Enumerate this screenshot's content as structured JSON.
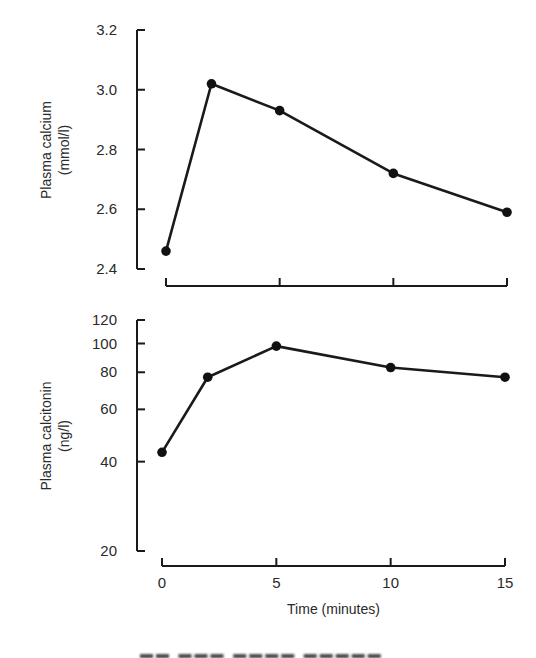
{
  "chart_data": [
    {
      "type": "line",
      "title": "",
      "xlabel": "",
      "ylabel": "Plasma calcium",
      "ylabel_unit": "(mmol/l)",
      "x": [
        0,
        2,
        5,
        10,
        15
      ],
      "series": [
        {
          "name": "Plasma calcium",
          "values": [
            2.46,
            3.02,
            2.93,
            2.72,
            2.59
          ]
        }
      ],
      "ylim": [
        2.4,
        3.2
      ],
      "yticks": [
        2.4,
        2.6,
        2.8,
        3.0,
        3.2
      ],
      "ytick_labels": [
        "2.4",
        "2.6",
        "2.8",
        "3.0",
        "3.2"
      ],
      "xlim": [
        0,
        15
      ],
      "xticks": [
        0,
        5,
        10,
        15
      ],
      "show_xtick_labels": false,
      "yscale": "linear",
      "grid": false,
      "markers": "filled-circle"
    },
    {
      "type": "line",
      "title": "",
      "xlabel": "Time (minutes)",
      "ylabel": "Plasma calcitonin",
      "ylabel_unit": "(ng/l)",
      "x": [
        0,
        2,
        5,
        10,
        15
      ],
      "series": [
        {
          "name": "Plasma calcitonin",
          "values": [
            43,
            77,
            98,
            83,
            77
          ]
        }
      ],
      "ylim": [
        20,
        120
      ],
      "yticks": [
        20,
        40,
        60,
        80,
        100,
        120
      ],
      "ytick_labels": [
        "20",
        "40",
        "60",
        "80",
        "100",
        "120"
      ],
      "xlim": [
        0,
        15
      ],
      "xticks": [
        0,
        5,
        10,
        15
      ],
      "xtick_labels": [
        "0",
        "5",
        "10",
        "15"
      ],
      "yscale": "log",
      "grid": false,
      "markers": "filled-circle"
    }
  ]
}
